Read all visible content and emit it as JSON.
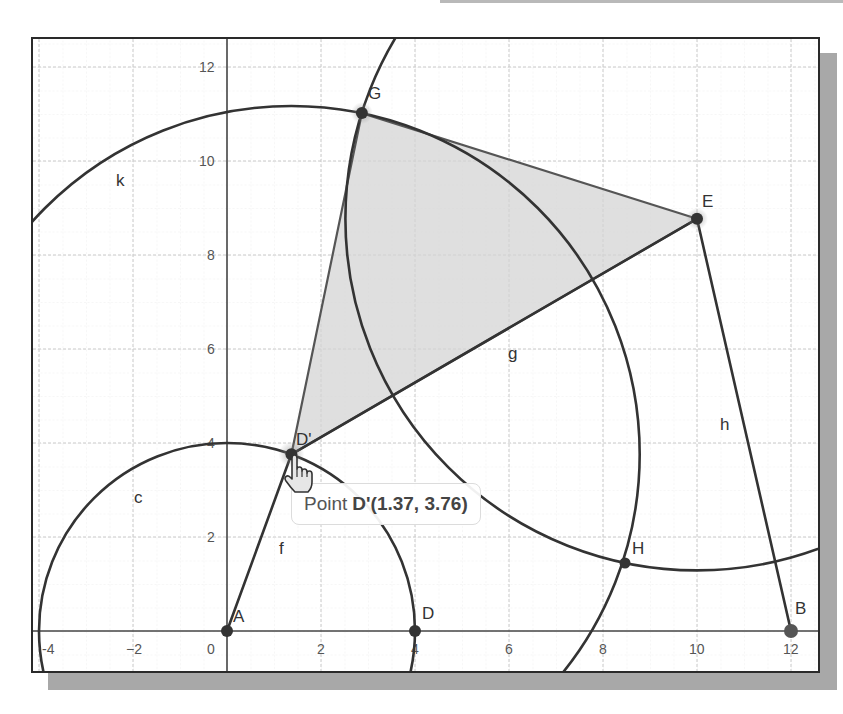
{
  "app": "GeoGebra Graphics View",
  "colors": {
    "line": "#333333",
    "polygon_fill": "#d6d6d6",
    "polygon_edge": "#555555",
    "grid_major": "#c8c8c8",
    "grid_minor": "#ececec",
    "axis": "#444444",
    "point": "#333333",
    "point_B": "#555555"
  },
  "axes": {
    "x_ticks": [
      "-4",
      "−2",
      "0",
      "2",
      "4",
      "6",
      "8",
      "10",
      "12"
    ],
    "y_ticks": [
      "2",
      "4",
      "6",
      "8",
      "10",
      "12"
    ]
  },
  "points": [
    {
      "name": "A",
      "label": "A",
      "x": 0,
      "y": 0
    },
    {
      "name": "D",
      "label": "D",
      "x": 4,
      "y": 0
    },
    {
      "name": "B",
      "label": "B",
      "x": 12,
      "y": 0
    },
    {
      "name": "D'",
      "label": "D'",
      "x": 1.37,
      "y": 3.76
    },
    {
      "name": "E",
      "label": "E",
      "x": 10,
      "y": 8.77
    },
    {
      "name": "G",
      "label": "G",
      "x": 2.87,
      "y": 11.02
    },
    {
      "name": "H",
      "label": "H",
      "x": 8.47,
      "y": 1.45
    }
  ],
  "objects": {
    "circle_c": {
      "label": "c",
      "center": "A",
      "radius": 4
    },
    "circle_k": {
      "label": "k",
      "center": "D'",
      "radius": 7.41
    },
    "circle_e": {
      "label": "",
      "center": "E",
      "radius": 7.48
    },
    "segment_f": {
      "label": "f",
      "from": "A",
      "to": "D'"
    },
    "segment_g": {
      "label": "g",
      "from": "D'",
      "to": "E"
    },
    "segment_h": {
      "label": "h",
      "from": "E",
      "to": "B"
    },
    "polygon": {
      "vertices": [
        "D'",
        "G",
        "E"
      ]
    }
  },
  "tooltip": {
    "prefix": "Point",
    "value": "D'(1.37, 3.76)"
  },
  "cursor": "pointing-hand-cursor"
}
